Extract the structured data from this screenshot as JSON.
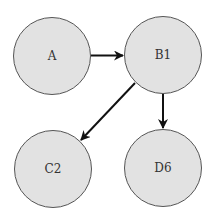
{
  "diagram": {
    "type": "directed-graph",
    "colors": {
      "node_fill": "#e2e2e2",
      "node_stroke": "#555555",
      "edge": "#111111",
      "label": "#333333"
    },
    "nodes": [
      {
        "id": "A",
        "label": "A",
        "cx": 52,
        "cy": 56,
        "r": 38.5
      },
      {
        "id": "B1",
        "label": "B1",
        "cx": 163,
        "cy": 55,
        "r": 38.5
      },
      {
        "id": "C2",
        "label": "C2",
        "cx": 53,
        "cy": 169,
        "r": 38.5
      },
      {
        "id": "D6",
        "label": "D6",
        "cx": 163,
        "cy": 168,
        "r": 38.5
      }
    ],
    "edges": [
      {
        "from": "A",
        "to": "B1"
      },
      {
        "from": "B1",
        "to": "C2"
      },
      {
        "from": "B1",
        "to": "D6"
      }
    ]
  }
}
